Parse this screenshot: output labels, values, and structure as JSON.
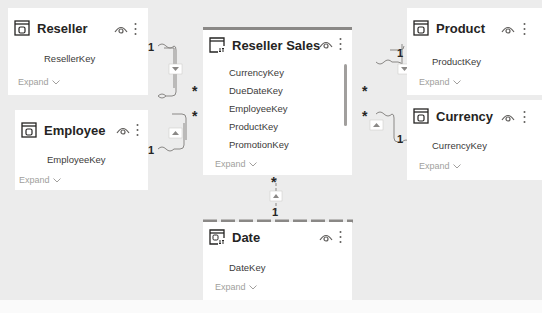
{
  "canvas": {
    "background": "#ececec"
  },
  "tables": {
    "reseller": {
      "title": "Reseller",
      "fields": [
        "ResellerKey"
      ],
      "expand": "Expand"
    },
    "employee": {
      "title": "Employee",
      "fields": [
        "EmployeeKey"
      ],
      "expand": "Expand"
    },
    "reseller_sales": {
      "title": "Reseller Sales",
      "fields": [
        "CurrencyKey",
        "DueDateKey",
        "EmployeeKey",
        "ProductKey",
        "PromotionKey"
      ],
      "expand": "Expand"
    },
    "product": {
      "title": "Product",
      "fields": [
        "ProductKey"
      ],
      "expand": "Expand"
    },
    "currency": {
      "title": "Currency",
      "fields": [
        "CurrencyKey"
      ],
      "expand": "Expand"
    },
    "date": {
      "title": "Date",
      "fields": [
        "DateKey"
      ],
      "expand": "Expand"
    }
  },
  "relationships": [
    {
      "from": "Reseller",
      "to": "Reseller Sales",
      "one": "1",
      "many": "*"
    },
    {
      "from": "Employee",
      "to": "Reseller Sales",
      "one": "1",
      "many": "*"
    },
    {
      "from": "Product",
      "to": "Reseller Sales",
      "one": "1",
      "many": "*"
    },
    {
      "from": "Currency",
      "to": "Reseller Sales",
      "one": "1",
      "many": "*"
    },
    {
      "from": "Date",
      "to": "Reseller Sales",
      "one": "1",
      "many": "*"
    }
  ],
  "cardinality": {
    "one": "1",
    "many": "*"
  }
}
